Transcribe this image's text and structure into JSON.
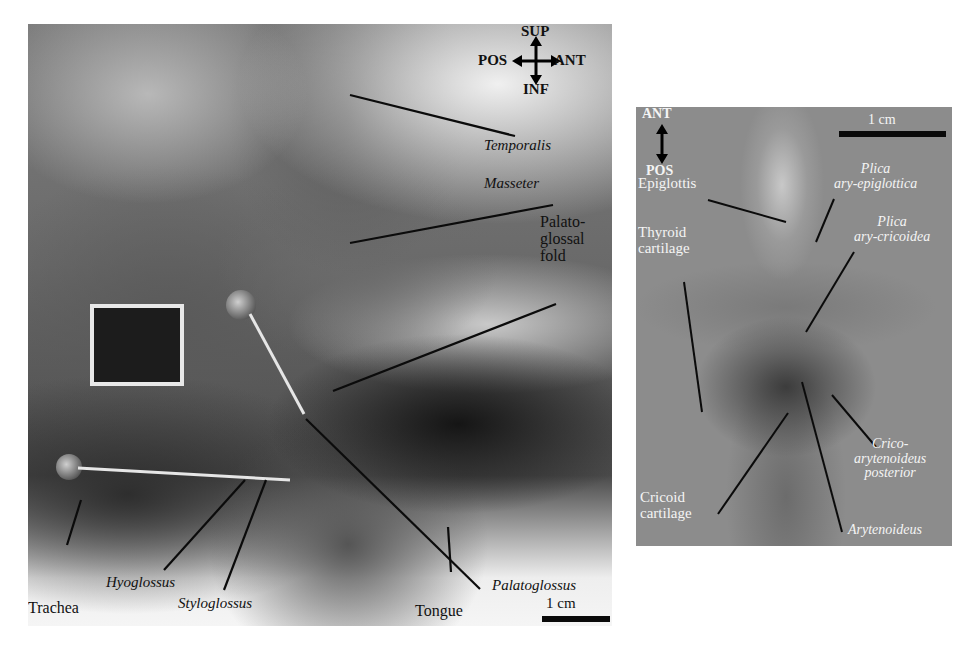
{
  "figure": {
    "panel_a": {
      "orientation": {
        "up": "SUP",
        "down": "INF",
        "left": "POS",
        "right": "ANT"
      },
      "labels": {
        "temporalis": "Temporalis",
        "masseter": "Masseter",
        "palatoglossal_fold_line1": "Palato-",
        "palatoglossal_fold_line2": "glossal",
        "palatoglossal_fold_line3": "fold",
        "palatoglossus": "Palatoglossus",
        "tongue": "Tongue",
        "trachea": "Trachea",
        "hyoglossus": "Hyoglossus",
        "styloglossus": "Styloglossus"
      },
      "scale_bar": "1 cm"
    },
    "panel_b": {
      "orientation": {
        "up": "ANT",
        "down": "POS"
      },
      "labels": {
        "epiglottis": "Epiglottis",
        "plica_ary_epiglottica_line1": "Plica",
        "plica_ary_epiglottica_line2": "ary-epiglottica",
        "plica_ary_cricoidea_line1": "Plica",
        "plica_ary_cricoidea_line2": "ary-cricoidea",
        "thyroid_cartilage_line1": "Thyroid",
        "thyroid_cartilage_line2": "cartilage",
        "crico_arytenoideus_line1": "Crico-",
        "crico_arytenoideus_line2": "arytenoideus",
        "crico_arytenoideus_line3": "posterior",
        "cricoid_cartilage_line1": "Cricoid",
        "cricoid_cartilage_line2": "cartilage",
        "arytenoideus": "Arytenoideus"
      },
      "scale_bar": "1 cm"
    }
  }
}
